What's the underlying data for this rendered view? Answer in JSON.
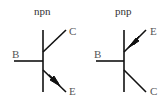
{
  "npn": {
    "title": "npn",
    "base": "B",
    "collector": "C",
    "emitter": "E"
  },
  "pnp": {
    "title": "pnp",
    "base": "B",
    "collector": "C",
    "emitter": "E"
  },
  "colors": {
    "line": "#111111",
    "label": "#555555"
  }
}
